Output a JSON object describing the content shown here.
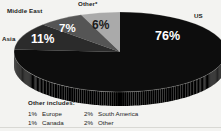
{
  "chart_data": {
    "type": "pie",
    "title": "",
    "subtitle": "",
    "xlabel": "",
    "ylabel": "",
    "legend_position": "callout-labels",
    "three_d": true,
    "categories": [
      "US",
      "Asia",
      "Middle East",
      "Other"
    ],
    "values": [
      76,
      11,
      7,
      6
    ],
    "value_suffix": "%",
    "slices": [
      {
        "label": "US",
        "value": 76,
        "value_text": "76%",
        "color": "#0d0d0d",
        "side_color": "#000000",
        "text_color": "#ffffff"
      },
      {
        "label": "Asia",
        "value": 11,
        "value_text": "11%",
        "color": "#2b2b2b",
        "side_color": "#131313",
        "text_color": "#ffffff"
      },
      {
        "label": "Middle East",
        "value": 7,
        "value_text": "7%",
        "color": "#555555",
        "side_color": "#333333",
        "text_color": "#ffffff"
      },
      {
        "label": "Other",
        "value": 6,
        "value_text": "6%",
        "color": "#aaaaaa",
        "side_color": "#777777",
        "text_color": "#1a1a1a"
      }
    ],
    "annotations": {
      "other_marker": "*"
    },
    "footnote": {
      "title": "Other includes:",
      "entries": [
        {
          "pct": "1%",
          "name": "Europe"
        },
        {
          "pct": "2%",
          "name": "South America"
        },
        {
          "pct": "1%",
          "name": "Canada"
        },
        {
          "pct": "2%",
          "name": "Other"
        }
      ]
    }
  },
  "labels": {
    "us": "US",
    "asia": "Asia",
    "middle_east": "Middle East",
    "other": "Other",
    "other_star": "Other*"
  },
  "percents": {
    "us": "76%",
    "asia": "11%",
    "middle_east": "7%",
    "other": "6%"
  },
  "footnote": {
    "title": "Other includes:",
    "r1c1_pct": "1%",
    "r1c1_name": "Europe",
    "r1c2_pct": "2%",
    "r1c2_name": "South America",
    "r2c1_pct": "1%",
    "r2c1_name": "Canada",
    "r2c2_pct": "2%",
    "r2c2_name": "Other"
  },
  "colors": {
    "background": "#f3f3f1",
    "us": "#0d0d0d",
    "asia": "#2b2b2b",
    "middle_east": "#555555",
    "other": "#aaaaaa",
    "rule": "#d8d8d4"
  }
}
